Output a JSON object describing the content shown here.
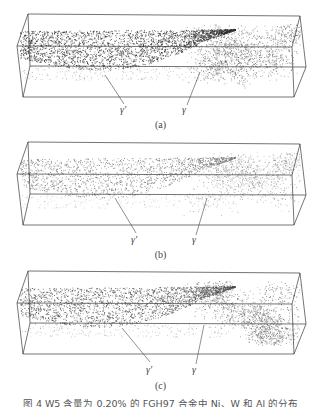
{
  "figure": {
    "caption": "图 4   W5 含量为 0.20% 的 FGH97 合金中 Ni、W 和 Al 的分布",
    "panels": [
      {
        "id": "a",
        "label": "(a)",
        "top": 0,
        "phase_labels": {
          "gamma_prime": "γ′",
          "gamma": "γ"
        },
        "gamma_prime_density": 1.0,
        "gamma_prime_color": "#2a2a2a",
        "gamma_color": "#5a5a5a",
        "gamma_density": 0.75,
        "seed": 11
      },
      {
        "id": "b",
        "label": "(b)",
        "top": 128,
        "phase_labels": {
          "gamma_prime": "γ′",
          "gamma": "γ"
        },
        "gamma_prime_density": 0.55,
        "gamma_prime_color": "#707070",
        "gamma_color": "#8a8a8a",
        "gamma_density": 0.55,
        "seed": 23
      },
      {
        "id": "c",
        "label": "(c)",
        "top": 257,
        "phase_labels": {
          "gamma_prime": "γ′",
          "gamma": "γ"
        },
        "gamma_prime_density": 0.8,
        "gamma_prime_color": "#474747",
        "gamma_color": "#5e5e5e",
        "gamma_density": 0.75,
        "seed": 37
      }
    ],
    "box_color": "#3a3a3a"
  }
}
